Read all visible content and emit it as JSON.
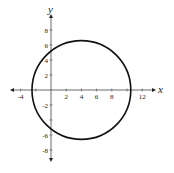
{
  "chart_data": {
    "type": "line",
    "title": "",
    "xlabel": "x",
    "ylabel": "y",
    "xlim": [
      -5.5,
      14
    ],
    "ylim": [
      -9.5,
      10
    ],
    "x_ticks": [
      -4,
      2,
      4,
      6,
      8,
      12
    ],
    "y_ticks": [
      8,
      6,
      4,
      2,
      -2,
      -6,
      -8
    ],
    "x_tick_labels": [
      "-4",
      "2",
      "4",
      "6",
      "8",
      "12"
    ],
    "y_tick_labels": [
      "8",
      "6",
      "4",
      "2",
      "-2",
      "-6",
      "-8"
    ],
    "grid": false,
    "series": [
      {
        "name": "circle",
        "center": [
          4,
          0
        ],
        "radius": 6.5,
        "color": "#111111"
      }
    ]
  }
}
